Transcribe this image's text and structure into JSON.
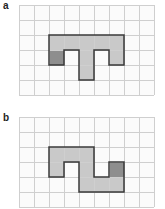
{
  "colors": {
    "grid_line": "#cfcfcf",
    "grid_bg": "#fbfbfb",
    "light_fill": "#c9c9c9",
    "dark_fill": "#8e8e8e",
    "outline": "#3a3a3a"
  },
  "panels": [
    {
      "label": "a",
      "grid": {
        "cols": 9,
        "rows": 6,
        "cell": 15,
        "origin": [
          19,
          5
        ]
      },
      "light_cells": [
        [
          2,
          2
        ],
        [
          3,
          2
        ],
        [
          4,
          2
        ],
        [
          5,
          2
        ],
        [
          6,
          2
        ],
        [
          4,
          3
        ],
        [
          6,
          3
        ],
        [
          4,
          4
        ]
      ],
      "dark_cells": [
        [
          2,
          3
        ]
      ],
      "outline": [
        [
          2,
          2
        ],
        [
          7,
          2
        ],
        [
          7,
          4
        ],
        [
          6,
          4
        ],
        [
          6,
          3
        ],
        [
          5,
          3
        ],
        [
          5,
          5
        ],
        [
          4,
          5
        ],
        [
          4,
          3
        ],
        [
          3,
          3
        ],
        [
          3,
          4
        ],
        [
          2,
          4
        ]
      ]
    },
    {
      "label": "b",
      "grid": {
        "cols": 9,
        "rows": 6,
        "cell": 15,
        "origin": [
          19,
          117
        ]
      },
      "light_cells": [
        [
          2,
          2
        ],
        [
          3,
          2
        ],
        [
          4,
          2
        ],
        [
          2,
          3
        ],
        [
          4,
          3
        ],
        [
          4,
          4
        ],
        [
          5,
          4
        ],
        [
          6,
          4
        ]
      ],
      "dark_cells": [
        [
          6,
          3
        ]
      ],
      "outline": [
        [
          2,
          2
        ],
        [
          5,
          2
        ],
        [
          5,
          4
        ],
        [
          6,
          4
        ],
        [
          6,
          3
        ],
        [
          7,
          3
        ],
        [
          7,
          5
        ],
        [
          4,
          5
        ],
        [
          4,
          3
        ],
        [
          3,
          3
        ],
        [
          3,
          4
        ],
        [
          2,
          4
        ]
      ]
    }
  ]
}
